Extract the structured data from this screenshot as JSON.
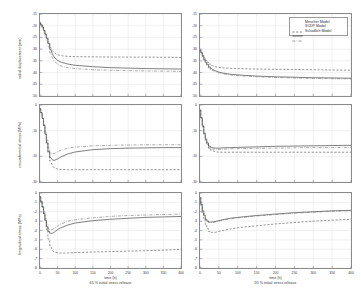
{
  "figure": {
    "type": "multi-panel-line-chart",
    "rows": 3,
    "cols": 2,
    "background": "#ffffff",
    "axis_color": "#8a8a8a",
    "grid_color": "#d9d9d9"
  },
  "legend": {
    "position": "top-right-panel",
    "entries": [
      {
        "label": "Mirscher Model",
        "style": "dashed",
        "color": "#555555"
      },
      {
        "label": "SCDP Model",
        "style": "solid",
        "color": "#333333"
      },
      {
        "label": "Schädlich Model",
        "style": "dashdot",
        "color": "#777777"
      }
    ]
  },
  "columns": [
    {
      "xlabel": "time (h)",
      "sublabel": "65 % initial stress release"
    },
    {
      "xlabel": "time (h)",
      "sublabel": "95 % initial stress release"
    }
  ],
  "rows": [
    {
      "ylabel": "radial displacement (mm)"
    },
    {
      "ylabel": "circumferential stress (MPa)"
    },
    {
      "ylabel": "longitudinal stress (MPa)"
    }
  ],
  "chart_data": [
    {
      "type": "line",
      "panel": "row1-col1",
      "title": "",
      "xlabel": "time (h)",
      "ylabel": "radial displacement (mm)",
      "xlim": [
        0,
        400
      ],
      "ylim": [
        -50,
        -15
      ],
      "xticks": [
        0,
        50,
        100,
        150,
        200,
        250,
        300,
        350,
        400
      ],
      "yticks": [
        -15,
        -20,
        -25,
        -30,
        -35,
        -40,
        -45,
        -50
      ],
      "grid": true,
      "legend_position": "none",
      "series": [
        {
          "name": "Mirscher Model",
          "style": "dashed",
          "x": [
            0,
            4,
            8,
            12,
            16,
            20,
            25,
            30,
            35,
            40,
            50,
            60,
            80,
            100,
            150,
            200,
            250,
            300,
            350,
            400
          ],
          "y": [
            -18.8,
            -19.6,
            -20.6,
            -22.0,
            -23.6,
            -25.4,
            -27.4,
            -29.2,
            -30.6,
            -31.5,
            -32.4,
            -32.8,
            -33.1,
            -33.2,
            -33.3,
            -33.35,
            -33.4,
            -33.4,
            -33.45,
            -33.5
          ]
        },
        {
          "name": "SCDP Model",
          "style": "solid",
          "x": [
            0,
            4,
            8,
            12,
            16,
            20,
            25,
            30,
            35,
            40,
            50,
            60,
            80,
            100,
            150,
            200,
            250,
            300,
            350,
            400
          ],
          "y": [
            -18.8,
            -19.6,
            -20.6,
            -22.0,
            -23.6,
            -25.4,
            -27.6,
            -30.0,
            -32.0,
            -33.4,
            -34.8,
            -35.6,
            -36.4,
            -36.9,
            -37.5,
            -37.9,
            -38.1,
            -38.3,
            -38.4,
            -38.5
          ]
        },
        {
          "name": "Schädlich Model",
          "style": "dashdot",
          "x": [
            0,
            4,
            8,
            12,
            16,
            20,
            25,
            30,
            35,
            40,
            50,
            60,
            80,
            100,
            150,
            200,
            250,
            300,
            350,
            400
          ],
          "y": [
            -18.8,
            -19.8,
            -21.0,
            -22.6,
            -24.4,
            -26.4,
            -29.0,
            -31.6,
            -33.6,
            -35.0,
            -36.5,
            -37.2,
            -37.9,
            -38.3,
            -38.8,
            -39.0,
            -39.2,
            -39.3,
            -39.4,
            -39.5
          ]
        }
      ]
    },
    {
      "type": "line",
      "panel": "row1-col2",
      "xlabel": "time (h)",
      "ylabel": "radial displacement (mm)",
      "xlim": [
        0,
        400
      ],
      "ylim": [
        -50,
        -15
      ],
      "xticks": [
        0,
        50,
        100,
        150,
        200,
        250,
        300,
        350,
        400
      ],
      "yticks": [
        -15,
        -20,
        -25,
        -30,
        -35,
        -40,
        -45,
        -50
      ],
      "grid": true,
      "legend_position": "upper right",
      "series": [
        {
          "name": "Mirscher Model",
          "style": "dashed",
          "x": [
            0,
            4,
            8,
            12,
            16,
            20,
            25,
            30,
            40,
            50,
            60,
            80,
            100,
            150,
            200,
            250,
            300,
            350,
            400
          ],
          "y": [
            -30.4,
            -31.4,
            -32.6,
            -33.8,
            -34.8,
            -35.6,
            -36.4,
            -36.9,
            -37.5,
            -37.8,
            -38.0,
            -38.2,
            -38.3,
            -38.5,
            -38.6,
            -38.7,
            -38.8,
            -38.9,
            -39.0
          ]
        },
        {
          "name": "SCDP Model",
          "style": "solid",
          "x": [
            0,
            4,
            8,
            12,
            16,
            20,
            25,
            30,
            40,
            50,
            60,
            80,
            100,
            150,
            200,
            250,
            300,
            350,
            400
          ],
          "y": [
            -30.4,
            -31.6,
            -33.0,
            -34.4,
            -35.6,
            -36.6,
            -37.6,
            -38.3,
            -39.2,
            -39.8,
            -40.2,
            -40.7,
            -41.0,
            -41.5,
            -41.8,
            -42.0,
            -42.2,
            -42.3,
            -42.4
          ]
        },
        {
          "name": "Schädlich Model",
          "style": "dashdot",
          "x": [
            0,
            4,
            8,
            12,
            16,
            20,
            25,
            30,
            40,
            50,
            60,
            80,
            100,
            150,
            200,
            250,
            300,
            350,
            400
          ],
          "y": [
            -30.4,
            -31.7,
            -33.2,
            -34.7,
            -36.0,
            -37.0,
            -38.0,
            -38.7,
            -39.6,
            -40.1,
            -40.5,
            -41.0,
            -41.3,
            -41.8,
            -42.1,
            -42.3,
            -42.5,
            -42.6,
            -42.7
          ]
        }
      ]
    },
    {
      "type": "line",
      "panel": "row2-col1",
      "xlabel": "time (h)",
      "ylabel": "circumferential stress (MPa)",
      "xlim": [
        0,
        400
      ],
      "ylim": [
        -30,
        0
      ],
      "xticks": [
        0,
        50,
        100,
        150,
        200,
        250,
        300,
        350,
        400
      ],
      "yticks": [
        0,
        -10,
        -20,
        -30
      ],
      "grid": true,
      "legend_position": "none",
      "series": [
        {
          "name": "Mirscher Model",
          "style": "dashed",
          "x": [
            0,
            4,
            8,
            12,
            16,
            20,
            25,
            30,
            35,
            40,
            50,
            60,
            80,
            100,
            150,
            200,
            250,
            300,
            350,
            400
          ],
          "y": [
            -1.5,
            -3.0,
            -5.2,
            -8.0,
            -11.2,
            -14.6,
            -18.6,
            -21.8,
            -23.6,
            -24.4,
            -25.0,
            -25.1,
            -25.2,
            -25.2,
            -25.2,
            -25.2,
            -25.2,
            -25.2,
            -25.2,
            -25.2
          ]
        },
        {
          "name": "SCDP Model",
          "style": "solid",
          "x": [
            0,
            4,
            8,
            12,
            16,
            20,
            25,
            30,
            35,
            40,
            50,
            60,
            80,
            100,
            150,
            200,
            250,
            300,
            350,
            400
          ],
          "y": [
            -1.5,
            -3.0,
            -5.2,
            -8.0,
            -11.4,
            -14.8,
            -18.2,
            -20.4,
            -21.4,
            -21.6,
            -21.0,
            -20.2,
            -19.0,
            -18.3,
            -17.4,
            -17.0,
            -16.8,
            -16.7,
            -16.6,
            -16.6
          ]
        },
        {
          "name": "Schädlich Model",
          "style": "dashdot",
          "x": [
            0,
            4,
            8,
            12,
            16,
            20,
            25,
            30,
            35,
            40,
            50,
            60,
            80,
            100,
            150,
            200,
            250,
            300,
            350,
            400
          ],
          "y": [
            -1.5,
            -3.0,
            -5.0,
            -7.6,
            -10.6,
            -13.6,
            -16.6,
            -18.4,
            -19.0,
            -18.9,
            -18.2,
            -17.6,
            -16.8,
            -16.4,
            -15.9,
            -15.7,
            -15.6,
            -15.5,
            -15.5,
            -15.5
          ]
        }
      ]
    },
    {
      "type": "line",
      "panel": "row2-col2",
      "xlabel": "time (h)",
      "ylabel": "circumferential stress (MPa)",
      "xlim": [
        0,
        400
      ],
      "ylim": [
        -30,
        0
      ],
      "xticks": [
        0,
        50,
        100,
        150,
        200,
        250,
        300,
        350,
        400
      ],
      "yticks": [
        0,
        -10,
        -20,
        -30
      ],
      "grid": true,
      "legend_position": "none",
      "series": [
        {
          "name": "Mirscher Model",
          "style": "dashed",
          "x": [
            0,
            4,
            8,
            12,
            16,
            20,
            25,
            30,
            40,
            50,
            60,
            80,
            100,
            150,
            200,
            250,
            300,
            350,
            400
          ],
          "y": [
            -2.0,
            -5.0,
            -8.2,
            -11.2,
            -13.6,
            -15.4,
            -16.8,
            -17.6,
            -18.2,
            -18.4,
            -18.4,
            -18.4,
            -18.4,
            -18.4,
            -18.4,
            -18.4,
            -18.4,
            -18.4,
            -18.4
          ]
        },
        {
          "name": "SCDP Model",
          "style": "solid",
          "x": [
            0,
            4,
            8,
            12,
            16,
            20,
            25,
            30,
            40,
            50,
            60,
            80,
            100,
            150,
            200,
            250,
            300,
            350,
            400
          ],
          "y": [
            -2.0,
            -5.0,
            -8.2,
            -11.0,
            -13.2,
            -14.8,
            -16.0,
            -16.5,
            -16.8,
            -16.8,
            -16.7,
            -16.6,
            -16.5,
            -16.3,
            -16.1,
            -16.0,
            -15.9,
            -15.8,
            -15.7
          ]
        },
        {
          "name": "Schädlich Model",
          "style": "dashdot",
          "x": [
            0,
            4,
            8,
            12,
            16,
            20,
            25,
            30,
            40,
            50,
            60,
            80,
            100,
            150,
            200,
            250,
            300,
            350,
            400
          ],
          "y": [
            -2.0,
            -5.2,
            -8.6,
            -11.6,
            -13.8,
            -15.4,
            -16.6,
            -17.1,
            -17.3,
            -17.3,
            -17.2,
            -17.1,
            -17.0,
            -16.9,
            -16.8,
            -16.7,
            -16.6,
            -16.6,
            -16.5
          ]
        }
      ]
    },
    {
      "type": "line",
      "panel": "row3-col1",
      "xlabel": "time (h)",
      "ylabel": "longitudinal stress (MPa)",
      "xlim": [
        0,
        400
      ],
      "ylim": [
        -8,
        0
      ],
      "xticks": [
        0,
        50,
        100,
        150,
        200,
        250,
        300,
        350,
        400
      ],
      "yticks": [
        0,
        -1,
        -2,
        -3,
        -4,
        -5,
        -6,
        -7,
        -8
      ],
      "grid": true,
      "legend_position": "none",
      "series": [
        {
          "name": "Mirscher Model",
          "style": "dashed",
          "x": [
            0,
            4,
            8,
            12,
            16,
            20,
            25,
            30,
            35,
            40,
            50,
            60,
            80,
            100,
            150,
            200,
            250,
            300,
            350,
            400
          ],
          "y": [
            -0.4,
            -0.9,
            -1.5,
            -2.2,
            -3.0,
            -3.9,
            -4.9,
            -5.6,
            -6.1,
            -6.3,
            -6.4,
            -6.4,
            -6.4,
            -6.35,
            -6.3,
            -6.25,
            -6.2,
            -6.15,
            -6.1,
            -6.0
          ]
        },
        {
          "name": "SCDP Model",
          "style": "solid",
          "x": [
            0,
            4,
            8,
            12,
            16,
            20,
            25,
            30,
            35,
            40,
            50,
            60,
            80,
            100,
            150,
            200,
            250,
            300,
            350,
            400
          ],
          "y": [
            -0.4,
            -0.9,
            -1.5,
            -2.2,
            -2.9,
            -3.6,
            -4.1,
            -4.3,
            -4.3,
            -4.2,
            -3.9,
            -3.7,
            -3.4,
            -3.2,
            -2.95,
            -2.8,
            -2.7,
            -2.6,
            -2.55,
            -2.5
          ]
        },
        {
          "name": "Schädlich Model",
          "style": "dashdot",
          "x": [
            0,
            4,
            8,
            12,
            16,
            20,
            25,
            30,
            35,
            40,
            50,
            60,
            80,
            100,
            150,
            200,
            250,
            300,
            350,
            400
          ],
          "y": [
            -0.4,
            -0.9,
            -1.4,
            -2.0,
            -2.7,
            -3.3,
            -3.8,
            -3.9,
            -3.9,
            -3.8,
            -3.5,
            -3.3,
            -3.0,
            -2.85,
            -2.65,
            -2.5,
            -2.4,
            -2.35,
            -2.3,
            -2.25
          ]
        }
      ]
    },
    {
      "type": "line",
      "panel": "row3-col2",
      "xlabel": "time (h)",
      "ylabel": "longitudinal stress (MPa)",
      "xlim": [
        0,
        400
      ],
      "ylim": [
        -8,
        0
      ],
      "xticks": [
        0,
        50,
        100,
        150,
        200,
        250,
        300,
        350,
        400
      ],
      "yticks": [
        0,
        -1,
        -2,
        -3,
        -4,
        -5,
        -6,
        -7,
        -8
      ],
      "grid": true,
      "legend_position": "none",
      "series": [
        {
          "name": "Mirscher Model",
          "style": "dashed",
          "x": [
            0,
            4,
            8,
            12,
            16,
            20,
            25,
            30,
            40,
            50,
            60,
            80,
            100,
            150,
            200,
            250,
            300,
            350,
            400
          ],
          "y": [
            -0.5,
            -1.3,
            -2.1,
            -2.8,
            -3.4,
            -3.8,
            -4.1,
            -4.2,
            -4.2,
            -4.1,
            -4.0,
            -3.85,
            -3.7,
            -3.5,
            -3.3,
            -3.15,
            -3.0,
            -2.9,
            -2.8
          ]
        },
        {
          "name": "SCDP Model",
          "style": "solid",
          "x": [
            0,
            4,
            8,
            12,
            16,
            20,
            25,
            30,
            40,
            50,
            60,
            80,
            100,
            150,
            200,
            250,
            300,
            350,
            400
          ],
          "y": [
            -0.5,
            -1.2,
            -1.9,
            -2.4,
            -2.8,
            -3.0,
            -3.1,
            -3.1,
            -3.05,
            -2.95,
            -2.85,
            -2.7,
            -2.6,
            -2.4,
            -2.25,
            -2.1,
            -2.0,
            -1.9,
            -1.85
          ]
        },
        {
          "name": "Schädlich Model",
          "style": "dashdot",
          "x": [
            0,
            4,
            8,
            12,
            16,
            20,
            25,
            30,
            40,
            50,
            60,
            80,
            100,
            150,
            200,
            250,
            300,
            350,
            400
          ],
          "y": [
            -0.5,
            -1.2,
            -1.9,
            -2.45,
            -2.85,
            -3.05,
            -3.15,
            -3.15,
            -3.1,
            -3.0,
            -2.9,
            -2.75,
            -2.65,
            -2.45,
            -2.3,
            -2.15,
            -2.05,
            -1.95,
            -1.9
          ]
        }
      ]
    }
  ]
}
